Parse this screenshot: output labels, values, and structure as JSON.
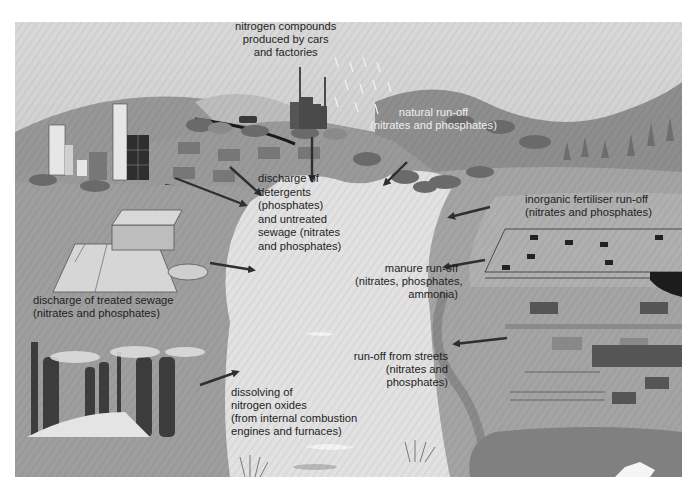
{
  "diagram": {
    "colors": {
      "sky": "#d4d4d4",
      "hills": "#8c8c8c",
      "land": "#a6a6a6",
      "river": "#e3e3e3",
      "arrow": "#2f2f2f",
      "buildings_dark": "#3a3a3a",
      "text": "#1e1e1e",
      "text_light": "#efefef"
    },
    "labels": {
      "nitrogen_compounds": [
        "nitrogen compounds",
        "produced by cars",
        "and factories"
      ],
      "natural_runoff": [
        "natural run-off",
        "(nitrates and phosphates)"
      ],
      "detergents": [
        "discharge of",
        "detergents",
        "(phosphates)",
        "and untreated",
        "sewage (nitrates",
        "and phosphates)"
      ],
      "fertiliser": [
        "inorganic fertiliser run-off",
        "(nitrates and phosphates)"
      ],
      "manure": [
        "manure run-off",
        "(nitrates, phosphates,",
        "ammonia)"
      ],
      "treated_sewage": [
        "discharge of treated sewage",
        "(nitrates and phosphates)"
      ],
      "streets": [
        "run-off from streets",
        "(nitrates and",
        "phosphates)"
      ],
      "nitrogen_oxides": [
        "dissolving of",
        "nitrogen oxides",
        "(from internal combustion",
        "engines and furnaces)"
      ]
    },
    "scene_elements": [
      "city-buildings",
      "factory-chimneys",
      "car-on-road",
      "houses",
      "bushes",
      "pine-trees",
      "sewage-treatment-plant",
      "settling-tank",
      "cows-in-field",
      "fenced-field",
      "barn",
      "power-station-chimneys",
      "spoil-heap",
      "farm-buildings",
      "river-reeds",
      "field-with-pond"
    ]
  }
}
